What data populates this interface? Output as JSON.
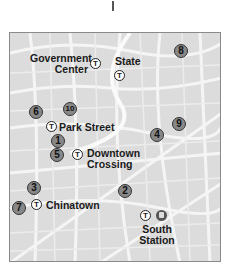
{
  "map": {
    "stations": [
      {
        "id": "government-center",
        "label_line1": "Government",
        "label_line2": "Center",
        "icon": "t-icon"
      },
      {
        "id": "state",
        "label": "State",
        "icon": "t-icon"
      },
      {
        "id": "park-street",
        "label": "Park Street",
        "icon": "t-icon"
      },
      {
        "id": "downtown-crossing",
        "label_line1": "Downtown",
        "label_line2": "Crossing",
        "icon": "t-icon"
      },
      {
        "id": "chinatown",
        "label": "Chinatown",
        "icon": "t-icon"
      },
      {
        "id": "south-station",
        "label_line1": "South",
        "label_line2": "Station",
        "icon": "t-icon",
        "secondary_icon": "commuter-rail-icon"
      }
    ],
    "t_symbol": "T",
    "markers": [
      "1",
      "2",
      "3",
      "4",
      "5",
      "6",
      "7",
      "8",
      "9",
      "10"
    ]
  },
  "colors": {
    "map_background": "#dcdcdc",
    "streets": "#f4f4f4",
    "marker_fill": "#888888",
    "text": "#1a1a1a"
  }
}
